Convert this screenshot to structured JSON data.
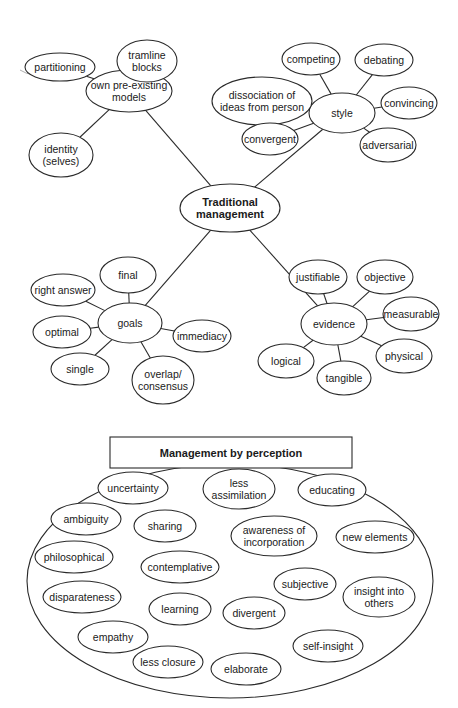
{
  "diagram": {
    "traditional": {
      "center": {
        "id": "traditional",
        "label_lines": [
          "Traditional",
          "management"
        ],
        "cx": 230,
        "cy": 208,
        "rx": 50,
        "ry": 24,
        "bold": true
      },
      "hubs": [
        {
          "id": "models",
          "label_lines": [
            "own pre-existing",
            "models"
          ],
          "cx": 129,
          "cy": 91,
          "rx": 43,
          "ry": 21,
          "children": [
            {
              "id": "partitioning",
              "label_lines": [
                "partitioning"
              ],
              "cx": 60,
              "cy": 67,
              "rx": 35,
              "ry": 14
            },
            {
              "id": "tramline-blocks",
              "label_lines": [
                "tramline",
                "blocks"
              ],
              "cx": 147,
              "cy": 61,
              "rx": 30,
              "ry": 21
            },
            {
              "id": "identity",
              "label_lines": [
                "identity",
                "(selves)"
              ],
              "cx": 61,
              "cy": 155,
              "rx": 32,
              "ry": 22
            }
          ]
        },
        {
          "id": "style",
          "label_lines": [
            "style"
          ],
          "cx": 342,
          "cy": 113,
          "rx": 33,
          "ry": 20,
          "children": [
            {
              "id": "competing",
              "label_lines": [
                "competing"
              ],
              "cx": 311,
              "cy": 59,
              "rx": 29,
              "ry": 16
            },
            {
              "id": "debating",
              "label_lines": [
                "debating"
              ],
              "cx": 384,
              "cy": 60,
              "rx": 29,
              "ry": 16
            },
            {
              "id": "dissociation",
              "label_lines": [
                "dissociation of",
                "ideas from person"
              ],
              "cx": 262,
              "cy": 101,
              "rx": 50,
              "ry": 24
            },
            {
              "id": "convincing",
              "label_lines": [
                "convincing"
              ],
              "cx": 409,
              "cy": 103,
              "rx": 28,
              "ry": 16
            },
            {
              "id": "convergent",
              "label_lines": [
                "convergent"
              ],
              "cx": 270,
              "cy": 139,
              "rx": 28,
              "ry": 16
            },
            {
              "id": "adversarial",
              "label_lines": [
                "adversarial"
              ],
              "cx": 388,
              "cy": 145,
              "rx": 28,
              "ry": 17
            }
          ]
        },
        {
          "id": "goals",
          "label_lines": [
            "goals"
          ],
          "cx": 130,
          "cy": 323,
          "rx": 32,
          "ry": 20,
          "children": [
            {
              "id": "final",
              "label_lines": [
                "final"
              ],
              "cx": 128,
              "cy": 275,
              "rx": 28,
              "ry": 18
            },
            {
              "id": "right-answer",
              "label_lines": [
                "right answer"
              ],
              "cx": 63,
              "cy": 290,
              "rx": 32,
              "ry": 16
            },
            {
              "id": "optimal",
              "label_lines": [
                "optimal"
              ],
              "cx": 62,
              "cy": 332,
              "rx": 29,
              "ry": 16
            },
            {
              "id": "single",
              "label_lines": [
                "single"
              ],
              "cx": 80,
              "cy": 369,
              "rx": 29,
              "ry": 16
            },
            {
              "id": "overlap-consensus",
              "label_lines": [
                "overlap/",
                "consensus"
              ],
              "cx": 163,
              "cy": 380,
              "rx": 31,
              "ry": 24
            },
            {
              "id": "immediacy",
              "label_lines": [
                "immediacy"
              ],
              "cx": 202,
              "cy": 336,
              "rx": 29,
              "ry": 16
            }
          ]
        },
        {
          "id": "evidence",
          "label_lines": [
            "evidence"
          ],
          "cx": 334,
          "cy": 324,
          "rx": 33,
          "ry": 21,
          "children": [
            {
              "id": "justifiable",
              "label_lines": [
                "justifiable"
              ],
              "cx": 318,
              "cy": 277,
              "rx": 29,
              "ry": 17
            },
            {
              "id": "objective",
              "label_lines": [
                "objective"
              ],
              "cx": 385,
              "cy": 277,
              "rx": 28,
              "ry": 17
            },
            {
              "id": "measurable",
              "label_lines": [
                "measurable"
              ],
              "cx": 411,
              "cy": 314,
              "rx": 28,
              "ry": 17
            },
            {
              "id": "physical",
              "label_lines": [
                "physical"
              ],
              "cx": 404,
              "cy": 356,
              "rx": 28,
              "ry": 17
            },
            {
              "id": "tangible",
              "label_lines": [
                "tangible"
              ],
              "cx": 344,
              "cy": 378,
              "rx": 27,
              "ry": 17
            },
            {
              "id": "logical",
              "label_lines": [
                "logical"
              ],
              "cx": 286,
              "cy": 361,
              "rx": 28,
              "ry": 17
            }
          ]
        }
      ]
    },
    "perception": {
      "title": "Management by perception",
      "title_box": {
        "x": 110,
        "y": 437,
        "w": 242,
        "h": 31
      },
      "frame": {
        "cx": 230,
        "cy": 581,
        "rx": 203,
        "ry": 117
      },
      "items": [
        {
          "id": "uncertainty",
          "label_lines": [
            "uncertainty"
          ],
          "cx": 133,
          "cy": 488,
          "rx": 35,
          "ry": 16
        },
        {
          "id": "less-assimilation",
          "label_lines": [
            "less",
            "assimilation"
          ],
          "cx": 239,
          "cy": 489,
          "rx": 36,
          "ry": 20
        },
        {
          "id": "educating",
          "label_lines": [
            "educating"
          ],
          "cx": 332,
          "cy": 490,
          "rx": 34,
          "ry": 16
        },
        {
          "id": "ambiguity",
          "label_lines": [
            "ambiguity"
          ],
          "cx": 86,
          "cy": 519,
          "rx": 35,
          "ry": 16
        },
        {
          "id": "sharing",
          "label_lines": [
            "sharing"
          ],
          "cx": 165,
          "cy": 526,
          "rx": 31,
          "ry": 16
        },
        {
          "id": "awareness-of-incorporation",
          "label_lines": [
            "awareness of",
            "incorporation"
          ],
          "cx": 274,
          "cy": 536,
          "rx": 43,
          "ry": 20
        },
        {
          "id": "new-elements",
          "label_lines": [
            "new elements"
          ],
          "cx": 375,
          "cy": 537,
          "rx": 39,
          "ry": 16
        },
        {
          "id": "philosophical",
          "label_lines": [
            "philosophical"
          ],
          "cx": 74,
          "cy": 557,
          "rx": 39,
          "ry": 16
        },
        {
          "id": "contemplative",
          "label_lines": [
            "contemplative"
          ],
          "cx": 180,
          "cy": 567,
          "rx": 39,
          "ry": 16
        },
        {
          "id": "subjective",
          "label_lines": [
            "subjective"
          ],
          "cx": 305,
          "cy": 584,
          "rx": 31,
          "ry": 16
        },
        {
          "id": "insight-into-others",
          "label_lines": [
            "insight into",
            "others"
          ],
          "cx": 379,
          "cy": 597,
          "rx": 36,
          "ry": 20
        },
        {
          "id": "disparateness",
          "label_lines": [
            "disparateness"
          ],
          "cx": 82,
          "cy": 597,
          "rx": 39,
          "ry": 16
        },
        {
          "id": "learning",
          "label_lines": [
            "learning"
          ],
          "cx": 180,
          "cy": 609,
          "rx": 31,
          "ry": 16
        },
        {
          "id": "divergent",
          "label_lines": [
            "divergent"
          ],
          "cx": 254,
          "cy": 613,
          "rx": 31,
          "ry": 16
        },
        {
          "id": "empathy",
          "label_lines": [
            "empathy"
          ],
          "cx": 113,
          "cy": 637,
          "rx": 35,
          "ry": 16
        },
        {
          "id": "self-insight",
          "label_lines": [
            "self-insight"
          ],
          "cx": 328,
          "cy": 646,
          "rx": 35,
          "ry": 16
        },
        {
          "id": "less-closure",
          "label_lines": [
            "less closure"
          ],
          "cx": 168,
          "cy": 662,
          "rx": 35,
          "ry": 16
        },
        {
          "id": "elaborate",
          "label_lines": [
            "elaborate"
          ],
          "cx": 246,
          "cy": 669,
          "rx": 35,
          "ry": 16
        }
      ]
    }
  }
}
